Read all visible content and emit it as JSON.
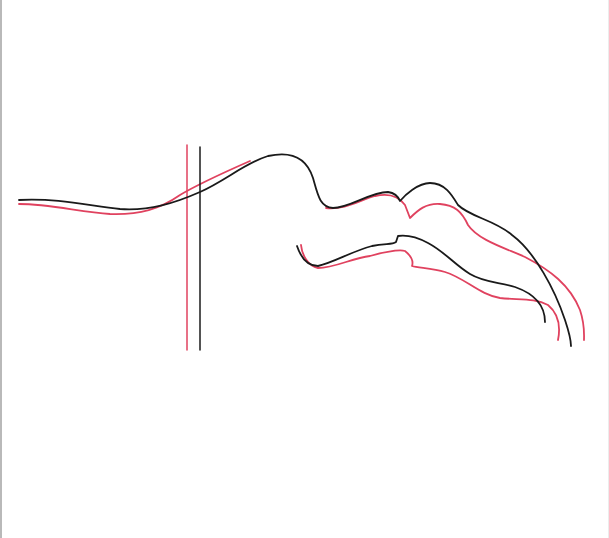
{
  "diagram": {
    "type": "superimposed line tracing",
    "colors": {
      "series_a": "#1a1a1a",
      "series_b": "#e0425f",
      "background": "#ffffff",
      "page_edge": "#b9b9b9"
    },
    "series": [
      {
        "name": "black tracing",
        "color": "#1a1a1a",
        "paths": {
          "reference_line": "M200 147 L200 350",
          "upper_profile": "M19 200 C60 198 90 206 120 209 C150 211 175 203 200 192 C225 181 245 163 268 156 C290 151 306 156 313 178 C318 196 320 207 333 208 C350 208 370 192 388 192 C395 193 398 196 400 201 C405 195 418 183 430 183 C445 183 452 195 458 205 C470 217 495 220 512 235 C535 252 555 290 565 320 C570 335 571 343 571 346",
          "lower_profile": "M297 246 C300 255 306 266 318 266 C335 262 350 252 372 246 C385 243 392 245 396 242 L398 236 C405 235 415 236 428 243 C445 252 455 265 470 274 C485 283 500 282 515 287 C535 294 545 305 545 322"
        }
      },
      {
        "name": "red tracing",
        "color": "#e0425f",
        "paths": {
          "reference_line": "M187 145 L187 350",
          "upper_profile": "M19 204 C50 204 80 212 110 214 C140 215 160 209 180 195 C200 183 225 172 250 161",
          "upper_profile_right": "M326 208 C345 210 360 200 375 196 C388 193 398 195 405 205 L410 218 C418 210 426 203 440 204 C455 205 462 212 468 225 C478 240 505 248 525 257 C550 270 570 285 580 310 C585 325 584 335 584 340",
          "lower_profile": "M301 245 C302 255 308 266 318 268 C335 268 352 258 370 256 C385 252 398 249 405 251 C410 255 414 260 412 266 C418 268 432 268 445 272 C465 278 480 295 500 298 C520 300 535 298 548 305 C560 315 560 330 558 340"
        }
      }
    ]
  }
}
